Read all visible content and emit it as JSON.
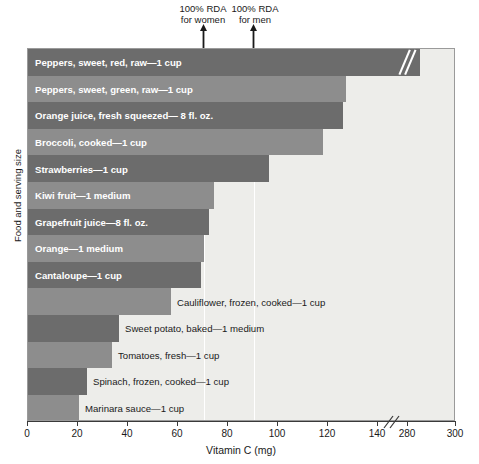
{
  "chart_data": {
    "type": "bar",
    "orientation": "horizontal",
    "title": "",
    "xlabel": "Vitamin C (mg)",
    "ylabel": "Food and serving size",
    "xlim": [
      0,
      300
    ],
    "xticks": [
      0,
      20,
      40,
      60,
      80,
      100,
      120,
      140,
      280,
      300
    ],
    "xticklabels": [
      "0",
      "20",
      "40",
      "60",
      "80",
      "100",
      "120",
      "140",
      "280",
      "300"
    ],
    "axis_break": {
      "after": 140,
      "before": 280,
      "label": "//"
    },
    "grid": false,
    "legend": null,
    "categories": [
      "Peppers, sweet, red, raw—1 cup",
      "Peppers, sweet, green, raw—1 cup",
      "Orange juice, fresh squeezed— 8 fl. oz.",
      "Broccoli, cooked—1 cup",
      "Strawberries—1 cup",
      "Kiwi fruit—1 medium",
      "Grapefruit juice—8 fl. oz.",
      "Orange—1 medium",
      "Cantaloupe—1 cup",
      "Cauliflower, frozen, cooked—1 cup",
      "Sweet potato, baked—1 medium",
      "Tomatoes, fresh—1 cup",
      "Spinach, frozen, cooked—1 cup",
      "Marinara sauce—1 cup"
    ],
    "values": [
      283,
      127,
      126,
      118,
      96,
      74,
      72,
      70,
      69,
      57,
      36,
      34,
      24,
      20
    ],
    "annotations": [
      {
        "text_line1": "100% RDA",
        "text_line2": "for women",
        "value": 70
      },
      {
        "text_line1": "100% RDA",
        "text_line2": "for men",
        "value": 90
      }
    ]
  },
  "bars": [
    {
      "label": "Peppers, sweet, red, raw—1 cup",
      "value": 283,
      "px": 392,
      "shade": "dark",
      "label_pos": "inside",
      "broken": true
    },
    {
      "label": "Peppers, sweet, green, raw—1 cup",
      "value": 127,
      "px": 318,
      "shade": "light",
      "label_pos": "inside",
      "broken": false
    },
    {
      "label": "Orange juice, fresh squeezed— 8 fl. oz.",
      "value": 126,
      "px": 315,
      "shade": "dark",
      "label_pos": "inside",
      "broken": false
    },
    {
      "label": "Broccoli, cooked—1 cup",
      "value": 118,
      "px": 295,
      "shade": "light",
      "label_pos": "inside",
      "broken": false
    },
    {
      "label": "Strawberries—1 cup",
      "value": 96,
      "px": 241,
      "shade": "dark",
      "label_pos": "inside",
      "broken": false
    },
    {
      "label": "Kiwi fruit—1 medium",
      "value": 74,
      "px": 186,
      "shade": "light",
      "label_pos": "inside",
      "broken": false
    },
    {
      "label": "Grapefruit juice—8 fl. oz.",
      "value": 72,
      "px": 181,
      "shade": "dark",
      "label_pos": "inside",
      "broken": false
    },
    {
      "label": "Orange—1 medium",
      "value": 70,
      "px": 176,
      "shade": "light",
      "label_pos": "inside",
      "broken": false
    },
    {
      "label": "Cantaloupe—1 cup",
      "value": 69,
      "px": 173,
      "shade": "dark",
      "label_pos": "inside",
      "broken": false
    },
    {
      "label": "Cauliflower, frozen, cooked—1 cup",
      "value": 57,
      "px": 143,
      "shade": "light",
      "label_pos": "outside",
      "broken": false
    },
    {
      "label": "Sweet potato, baked—1 medium",
      "value": 36,
      "px": 91,
      "shade": "dark",
      "label_pos": "outside",
      "broken": false
    },
    {
      "label": "Tomatoes, fresh—1 cup",
      "value": 34,
      "px": 84,
      "shade": "light",
      "label_pos": "outside",
      "broken": false
    },
    {
      "label": "Spinach, frozen, cooked—1 cup",
      "value": 24,
      "px": 59,
      "shade": "dark",
      "label_pos": "outside",
      "broken": false
    },
    {
      "label": "Marinara sauce—1 cup",
      "value": 20,
      "px": 51,
      "shade": "light",
      "label_pos": "outside",
      "broken": false
    }
  ],
  "annotations": {
    "women_line1": "100% RDA",
    "women_line2": "for women",
    "men_line1": "100% RDA",
    "men_line2": "for men"
  },
  "axis": {
    "x_title": "Vitamin C (mg)",
    "y_title": "Food and serving size",
    "ticks": [
      {
        "label": "0",
        "px": 0
      },
      {
        "label": "20",
        "px": 50
      },
      {
        "label": "40",
        "px": 100
      },
      {
        "label": "60",
        "px": 150
      },
      {
        "label": "80",
        "px": 200
      },
      {
        "label": "100",
        "px": 250
      },
      {
        "label": "120",
        "px": 300
      },
      {
        "label": "140",
        "px": 350
      },
      {
        "label": "280",
        "px": 380
      },
      {
        "label": "300",
        "px": 428
      }
    ]
  },
  "colors": {
    "bar_dark": "#6c6c6c",
    "bar_light": "#8d8d8d",
    "plot_background": "#ededea",
    "rda_line": "#ffffff",
    "axis": "#3a3a3a",
    "text": "#1a1a1a",
    "inside_label": "#ffffff"
  },
  "geometry": {
    "rda_women_px": 176,
    "rda_men_px": 226,
    "row_height": 26.6
  }
}
